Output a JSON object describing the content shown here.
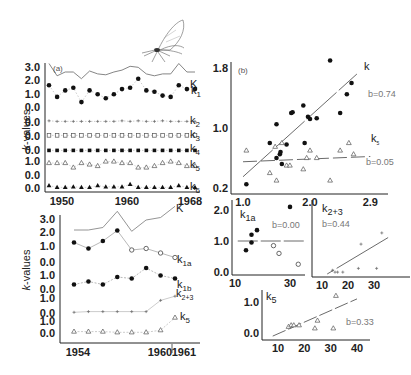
{
  "figure": {
    "illustration": "moth-icon",
    "y_axis_label": "k-values"
  },
  "chart_data": [
    {
      "id": "a",
      "type": "line",
      "panel_label": "(a)",
      "xlabel": "",
      "ylabel": "k-values",
      "x_ticks": [
        "1950",
        "1960",
        "1968"
      ],
      "x": [
        1950,
        1951,
        1952,
        1953,
        1954,
        1955,
        1956,
        1957,
        1958,
        1959,
        1960,
        1961,
        1962,
        1963,
        1964,
        1965,
        1966,
        1967,
        1968
      ],
      "series": [
        {
          "name": "K",
          "label": "K",
          "y_ticks": [
            "3.0",
            "2.0",
            "1.0"
          ],
          "style": "solid line",
          "values": [
            2.9,
            1.6,
            2.0,
            2.0,
            1.3,
            2.1,
            1.8,
            1.7,
            2.0,
            2.2,
            2.6,
            2.5,
            1.8,
            1.6,
            1.8,
            1.8,
            2.9,
            2.0,
            2.0
          ]
        },
        {
          "name": "k1",
          "label": "k",
          "sub": "1",
          "y_ticks": [
            "1.0",
            "0.0"
          ],
          "style": "filled circles, dotted",
          "values": [
            1.6,
            0.7,
            1.2,
            1.4,
            0.3,
            1.2,
            0.9,
            0.6,
            0.9,
            1.3,
            1.4,
            2.1,
            1.2,
            1.1,
            0.8,
            0.7,
            1.6,
            1.3,
            1.3
          ]
        },
        {
          "name": "k2",
          "label": "k",
          "sub": "2",
          "y_ticks": [
            "0.0"
          ],
          "style": "small crosses, dotted",
          "values": [
            0.1,
            0.05,
            0.05,
            0.05,
            0.05,
            0.05,
            0.05,
            0.05,
            0.05,
            0.1,
            0.05,
            0.1,
            0.05,
            0.05,
            0.1,
            0.05,
            0.05,
            0.05,
            0.05
          ]
        },
        {
          "name": "k3",
          "label": "k",
          "sub": "3",
          "y_ticks": [
            "0.0"
          ],
          "style": "open squares, dotted",
          "values": [
            0.05,
            0.05,
            0.05,
            0.05,
            0.05,
            0.05,
            0.05,
            0.05,
            0.05,
            0.05,
            0.05,
            0.05,
            0.05,
            0.05,
            0.05,
            0.05,
            0.05,
            0.05,
            0.05
          ]
        },
        {
          "name": "k4",
          "label": "k",
          "sub": "4",
          "y_ticks": [
            "0.0"
          ],
          "style": "filled squares, dotted",
          "values": [
            0.05,
            0.05,
            0.05,
            0.05,
            0.05,
            0.05,
            0.05,
            0.05,
            0.05,
            0.05,
            0.05,
            0.05,
            0.05,
            0.05,
            0.05,
            0.05,
            0.05,
            0.05,
            0.05
          ]
        },
        {
          "name": "k5",
          "label": "k",
          "sub": "5",
          "y_ticks": [
            "1.0",
            "0.0"
          ],
          "style": "open triangles, dotted",
          "values": [
            0.8,
            0.8,
            0.8,
            0.5,
            0.8,
            0.7,
            0.6,
            0.9,
            0.9,
            0.8,
            0.8,
            0.5,
            0.5,
            0.6,
            0.8,
            0.9,
            0.8,
            0.6,
            0.6
          ]
        },
        {
          "name": "k6",
          "label": "k",
          "sub": "6",
          "y_ticks": [
            "0.0"
          ],
          "style": "filled triangles, dotted",
          "values": [
            0.2,
            0.05,
            0.05,
            0.1,
            0.05,
            0.05,
            0.2,
            0.1,
            0.1,
            0.1,
            0.3,
            0.05,
            0.05,
            0.05,
            0.05,
            0.05,
            0.2,
            0.05,
            0.05
          ]
        }
      ]
    },
    {
      "id": "b",
      "type": "scatter",
      "panel_label": "(b)",
      "xlim": [
        1.0,
        2.9
      ],
      "ylim": [
        0.2,
        1.8
      ],
      "x_ticks": [
        "1.0",
        "2.0",
        "2.9"
      ],
      "y_ticks": [
        "1.8",
        "1.0",
        "0.2"
      ],
      "series": [
        {
          "name": "k",
          "label": "k",
          "marker": "filled circle",
          "slope_label": "b=0.74",
          "points": [
            [
              1.05,
              0.25
            ],
            [
              1.4,
              0.8
            ],
            [
              1.5,
              1.05
            ],
            [
              1.5,
              0.6
            ],
            [
              1.55,
              0.65
            ],
            [
              1.56,
              0.68
            ],
            [
              1.58,
              0.52
            ],
            [
              1.65,
              0.78
            ],
            [
              1.72,
              1.2
            ],
            [
              1.74,
              1.21
            ],
            [
              1.9,
              1.3
            ],
            [
              1.92,
              0.8
            ],
            [
              1.97,
              1.15
            ],
            [
              2.0,
              1.12
            ],
            [
              2.1,
              1.13
            ],
            [
              2.3,
              1.9
            ],
            [
              2.45,
              1.2
            ],
            [
              2.55,
              1.45
            ],
            [
              2.62,
              1.6
            ]
          ],
          "fit": [
            [
              1.0,
              0.35
            ],
            [
              2.7,
              1.72
            ]
          ]
        },
        {
          "name": "k5",
          "label": "k",
          "sub": "5",
          "marker": "open triangle",
          "slope_label": "b=0.05",
          "points": [
            [
              1.05,
              0.7
            ],
            [
              1.4,
              0.4
            ],
            [
              1.48,
              0.75
            ],
            [
              1.5,
              0.3
            ],
            [
              1.58,
              0.8
            ],
            [
              1.65,
              0.5
            ],
            [
              1.7,
              0.5
            ],
            [
              1.9,
              0.45
            ],
            [
              1.95,
              0.6
            ],
            [
              2.0,
              0.7
            ],
            [
              2.1,
              0.6
            ],
            [
              2.3,
              0.3
            ],
            [
              2.45,
              0.7
            ],
            [
              2.58,
              0.8
            ],
            [
              2.65,
              0.65
            ]
          ],
          "fit": [
            [
              1.0,
              0.55
            ],
            [
              2.9,
              0.62
            ]
          ]
        }
      ]
    },
    {
      "id": "c",
      "type": "line",
      "xlabel": "",
      "ylabel": "k-values",
      "x_ticks": [
        "1954",
        "1960",
        "1961"
      ],
      "x": [
        1954,
        1955,
        1956,
        1957,
        1958,
        1959,
        1960,
        1961
      ],
      "series": [
        {
          "name": "K",
          "label": "K",
          "y_ticks": [
            "3.0",
            "2.0",
            "1.0"
          ],
          "values": [
            1.6,
            1.6,
            1.8,
            3.1,
            1.5,
            2.4,
            2.6,
            3.5
          ]
        },
        {
          "name": "k1a",
          "label": "k",
          "sub": "1a",
          "y_ticks": [
            "1.0",
            "0.0"
          ],
          "values": [
            1.3,
            0.9,
            1.4,
            2.1,
            0.8,
            0.9,
            0.6,
            0.3
          ]
        },
        {
          "name": "k1b",
          "label": "k",
          "sub": "1b",
          "y_ticks": [
            "1.0",
            "0.0"
          ],
          "values": [
            0.3,
            0.5,
            0.3,
            0.8,
            0.7,
            1.4,
            0.9,
            0.7
          ]
        },
        {
          "name": "k2+3",
          "label": "k",
          "sub": "2+3",
          "y_ticks": [
            "1.0",
            "0.0"
          ],
          "values": [
            0.05,
            0.1,
            0.1,
            0.1,
            0.1,
            0.1,
            0.9,
            1.2
          ]
        },
        {
          "name": "k5",
          "label": "k",
          "sub": "5",
          "y_ticks": [
            "1.0",
            "0.0"
          ],
          "values": [
            0.1,
            0.1,
            0.1,
            0.05,
            0.05,
            0.05,
            0.2,
            1.1
          ]
        }
      ]
    },
    {
      "id": "d",
      "type": "scatter",
      "label": "k",
      "sub": "1a",
      "slope_label": "b=0.00",
      "x_ticks": [
        "10",
        "30"
      ],
      "y_ticks": [
        "2.0",
        "1.0",
        "0.0"
      ],
      "points_filled": [
        [
          14,
          0.7
        ],
        [
          16,
          0.95
        ],
        [
          16,
          1.2
        ],
        [
          18,
          1.35
        ],
        [
          30,
          2.1
        ]
      ],
      "points_open": [
        [
          24,
          0.85
        ],
        [
          26,
          0.6
        ],
        [
          33,
          0.25
        ]
      ],
      "fit": [
        [
          11,
          1.0
        ],
        [
          36,
          1.0
        ]
      ]
    },
    {
      "id": "e",
      "type": "scatter",
      "label": "k",
      "sub": "2+3",
      "slope_label": "b=0.44",
      "x_ticks": [
        "10",
        "20",
        "30"
      ],
      "y_ticks": [],
      "points": [
        [
          14,
          0.1
        ],
        [
          15,
          0.05
        ],
        [
          16,
          0.05
        ],
        [
          18,
          0.05
        ],
        [
          24,
          0.15
        ],
        [
          25,
          0.8
        ],
        [
          31,
          0.15
        ],
        [
          33,
          1.1
        ]
      ],
      "fit": [
        [
          12,
          0.0
        ],
        [
          36,
          1.0
        ]
      ]
    },
    {
      "id": "f",
      "type": "scatter",
      "label": "k",
      "sub": "5",
      "slope_label": "b=0.33",
      "x_ticks": [
        "10",
        "20",
        "30",
        "40"
      ],
      "y_ticks": [
        "1.0",
        "0.0"
      ],
      "points": [
        [
          14,
          0.2
        ],
        [
          15,
          0.25
        ],
        [
          16,
          0.25
        ],
        [
          18,
          0.25
        ],
        [
          24,
          0.15
        ],
        [
          25,
          0.4
        ],
        [
          31,
          0.15
        ],
        [
          32,
          1.2
        ]
      ],
      "fit": [
        [
          8,
          -0.1
        ],
        [
          40,
          1.1
        ]
      ]
    }
  ]
}
